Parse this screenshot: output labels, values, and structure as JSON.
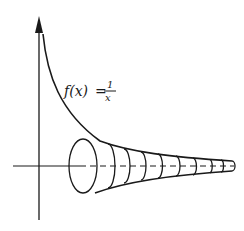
{
  "diagram": {
    "function_label": {
      "lhs": "f(x)",
      "equals": "=",
      "numerator": "1",
      "denominator": "x"
    },
    "colors": {
      "ink": "#1a1a1a",
      "background": "#ffffff"
    },
    "axes": {
      "vertical": {
        "has_arrow": true
      },
      "horizontal": {
        "dashed_inside_horn": true
      }
    },
    "horn": {
      "cross_sections": 9,
      "description": "solid of revolution formed by rotating y = 1/x about the x-axis"
    }
  }
}
